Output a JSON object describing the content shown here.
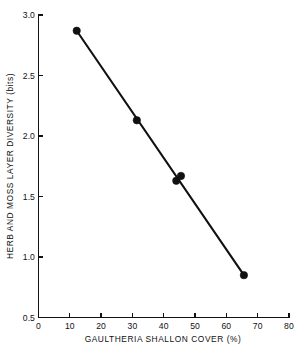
{
  "chart_data": {
    "type": "line",
    "title": "",
    "subtitle": "",
    "xlabel": "GAULTHERIA SHALLON COVER (%)",
    "ylabel": "HERB AND MOSS LAYER DIVERSITY (bits)",
    "xlim": [
      0,
      80
    ],
    "ylim": [
      0.5,
      3.0
    ],
    "xticks": [
      0,
      10,
      20,
      30,
      40,
      50,
      60,
      70,
      80
    ],
    "xtick_labels": [
      "0",
      "10",
      "20",
      "30",
      "40",
      "50",
      "60",
      "70",
      "80"
    ],
    "yticks": [
      0.5,
      1.0,
      1.5,
      2.0,
      2.5,
      3.0
    ],
    "ytick_labels": [
      "0.5",
      "1.0",
      "1.5",
      "2.0",
      "2.5",
      "3.0"
    ],
    "grid": false,
    "legend": "none",
    "marker_style": "filled-circle",
    "marker_color": "#111111",
    "line_color": "#111111",
    "series": [
      {
        "name": "Herb and moss layer diversity",
        "x": [
          12.2,
          31.4,
          44.0,
          45.5,
          65.6
        ],
        "values": [
          2.87,
          2.13,
          1.63,
          1.67,
          0.85
        ]
      }
    ],
    "points": [
      {
        "x": 12.2,
        "y": 2.87
      },
      {
        "x": 31.4,
        "y": 2.13
      },
      {
        "x": 44.0,
        "y": 1.63
      },
      {
        "x": 45.5,
        "y": 1.67
      },
      {
        "x": 65.6,
        "y": 0.85
      }
    ],
    "trend": "negative-linear"
  },
  "axes": {
    "x_title": "GAULTHERIA SHALLON COVER (%)",
    "y_title": "HERB AND MOSS LAYER DIVERSITY (bits)"
  }
}
